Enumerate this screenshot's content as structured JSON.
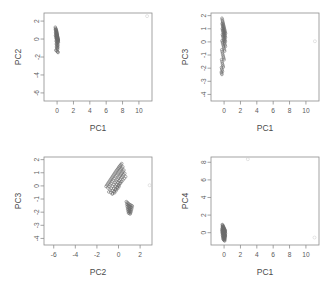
{
  "figure": {
    "title": "",
    "layout": "2x2 grid of PCA score scatterplots",
    "marker": "open-circle",
    "grid": false,
    "legend": "none"
  },
  "chart_data": [
    {
      "type": "scatter",
      "name": "pc2-vs-pc1",
      "title": "",
      "xlabel": "PC1",
      "ylabel": "PC2",
      "xlim": [
        -1.6,
        11.6
      ],
      "ylim": [
        -6.9,
        2.9
      ],
      "xticks": [
        0,
        2,
        4,
        6,
        8,
        10
      ],
      "yticks": [
        2,
        0,
        -2,
        -4,
        -6
      ],
      "grid": false,
      "series": [
        {
          "name": "scores",
          "x": [
            -0.22,
            -0.18,
            -0.15,
            -0.12,
            -0.1,
            -0.08,
            -0.06,
            -0.05,
            -0.03,
            -0.02,
            0.0,
            0.01,
            0.02,
            0.03,
            0.05,
            0.06,
            0.07,
            0.08,
            0.09,
            0.1,
            -0.2,
            -0.16,
            -0.13,
            -0.11,
            -0.09,
            -0.07,
            -0.04,
            -0.01,
            0.02,
            0.04,
            0.06,
            0.08,
            0.11,
            0.13,
            -0.17,
            -0.14,
            -0.12,
            -0.09,
            -0.06,
            -0.03,
            0.0,
            0.03,
            0.06,
            0.09,
            0.12,
            -0.19,
            -0.15,
            -0.1,
            -0.05,
            0.0,
            0.04,
            0.08,
            0.12,
            0.15,
            -0.13,
            -0.08,
            -0.04,
            0.01,
            0.05,
            0.09,
            -0.11,
            -0.06,
            -0.02,
            0.03,
            0.07,
            0.1,
            -0.09,
            -0.05,
            0.0,
            0.05,
            0.09,
            -0.07,
            -0.03,
            0.02,
            0.06,
            -0.14,
            -0.1,
            0.04,
            0.08,
            0.12
          ],
          "y": [
            1.32,
            1.2,
            1.12,
            1.05,
            0.98,
            0.9,
            0.84,
            0.76,
            0.7,
            0.62,
            0.55,
            0.48,
            0.4,
            0.33,
            0.26,
            0.18,
            0.12,
            0.05,
            -0.02,
            -0.1,
            1.05,
            0.95,
            0.86,
            0.78,
            0.68,
            0.6,
            0.5,
            0.42,
            0.33,
            0.24,
            0.15,
            0.06,
            -0.04,
            -0.13,
            0.72,
            0.63,
            0.54,
            0.45,
            0.36,
            0.27,
            0.18,
            0.09,
            0.0,
            -0.09,
            -0.18,
            0.4,
            0.32,
            0.22,
            0.12,
            0.02,
            -0.08,
            -0.18,
            -0.28,
            -0.36,
            0.1,
            0.0,
            -0.1,
            -0.2,
            -0.3,
            -0.4,
            -0.22,
            -0.32,
            -0.42,
            -0.52,
            -0.62,
            -0.7,
            -0.55,
            -0.65,
            -0.75,
            -0.85,
            -0.95,
            -0.88,
            -0.98,
            -1.06,
            -1.14,
            -1.22,
            -1.3,
            -1.38,
            -1.44,
            -1.5
          ]
        },
        {
          "name": "outlier",
          "x": [
            11.0
          ],
          "y": [
            2.55
          ]
        }
      ]
    },
    {
      "type": "scatter",
      "name": "pc3-vs-pc1",
      "title": "",
      "xlabel": "PC1",
      "ylabel": "PC3",
      "xlim": [
        -1.6,
        11.6
      ],
      "ylim": [
        -4.5,
        2.2
      ],
      "xticks": [
        0,
        2,
        4,
        6,
        8,
        10
      ],
      "yticks": [
        2,
        1,
        0,
        -1,
        -2,
        -3,
        -4
      ],
      "grid": false,
      "series": [
        {
          "name": "scores",
          "x": [
            -0.26,
            -0.22,
            -0.19,
            -0.16,
            -0.13,
            -0.1,
            -0.07,
            -0.04,
            -0.01,
            0.02,
            0.05,
            0.08,
            0.11,
            0.14,
            0.17,
            -0.24,
            -0.2,
            -0.17,
            -0.14,
            -0.11,
            -0.08,
            -0.05,
            -0.02,
            0.01,
            0.04,
            0.07,
            0.1,
            0.13,
            0.16,
            -0.22,
            -0.18,
            -0.15,
            -0.12,
            -0.09,
            -0.06,
            -0.03,
            0.0,
            0.03,
            0.06,
            0.09,
            0.12,
            0.15,
            -0.2,
            -0.16,
            -0.12,
            -0.08,
            -0.04,
            0.0,
            0.04,
            0.08,
            0.12,
            0.16,
            -0.25,
            -0.21,
            -0.17,
            -0.13,
            -0.09,
            -0.05,
            -0.01,
            0.03,
            0.07,
            -0.28,
            -0.24,
            -0.2,
            -0.16,
            -0.12,
            -0.08,
            -0.04,
            0.0,
            -0.3,
            -0.26,
            -0.22,
            -0.18,
            -0.14,
            -0.1,
            -0.32,
            -0.28,
            -0.24,
            -0.2,
            -0.34,
            -0.3,
            -0.26
          ],
          "y": [
            1.8,
            1.7,
            1.6,
            1.52,
            1.44,
            1.36,
            1.28,
            1.2,
            1.12,
            1.04,
            0.96,
            0.88,
            0.8,
            0.72,
            0.64,
            1.4,
            1.3,
            1.22,
            1.14,
            1.06,
            0.98,
            0.9,
            0.82,
            0.74,
            0.66,
            0.58,
            0.5,
            0.42,
            0.34,
            1.0,
            0.9,
            0.82,
            0.74,
            0.66,
            0.58,
            0.5,
            0.42,
            0.34,
            0.26,
            0.18,
            0.1,
            0.02,
            0.55,
            0.45,
            0.35,
            0.25,
            0.15,
            0.05,
            -0.05,
            -0.15,
            -0.25,
            -0.35,
            0.1,
            0.0,
            -0.1,
            -0.2,
            -0.3,
            -0.4,
            -0.5,
            -0.6,
            -0.7,
            -0.6,
            -0.72,
            -0.84,
            -0.96,
            -1.06,
            -1.16,
            -1.26,
            -1.36,
            -1.35,
            -1.48,
            -1.6,
            -1.72,
            -1.82,
            -1.92,
            -1.95,
            -2.06,
            -2.16,
            -2.26,
            -2.3,
            -2.4,
            -2.48
          ]
        },
        {
          "name": "outlier",
          "x": [
            11.1
          ],
          "y": [
            0.05
          ]
        }
      ]
    },
    {
      "type": "scatter",
      "name": "pc3-vs-pc2",
      "title": "",
      "xlabel": "PC2",
      "ylabel": "PC3",
      "xlim": [
        -6.9,
        3.1
      ],
      "ylim": [
        -4.5,
        2.2
      ],
      "xticks": [
        -6,
        -4,
        -2,
        0,
        2
      ],
      "yticks": [
        2,
        1,
        0,
        -1,
        -2,
        -3,
        -4
      ],
      "grid": false,
      "series": [
        {
          "name": "cluster-main",
          "x": [
            0.3,
            0.22,
            0.15,
            0.08,
            0.02,
            -0.05,
            -0.12,
            -0.2,
            -0.28,
            -0.36,
            -0.44,
            -0.52,
            -0.6,
            -0.68,
            -0.76,
            -0.84,
            -0.92,
            -1.0,
            -1.08,
            -1.16,
            0.4,
            0.32,
            0.24,
            0.16,
            0.08,
            0.0,
            -0.08,
            -0.18,
            -0.28,
            -0.38,
            -0.48,
            -0.58,
            -0.68,
            -0.78,
            -0.88,
            -0.98,
            0.5,
            0.42,
            0.34,
            0.26,
            0.18,
            0.1,
            0.0,
            -0.1,
            -0.2,
            -0.3,
            -0.42,
            -0.54,
            -0.66,
            -0.78,
            -0.9,
            0.58,
            0.48,
            0.38,
            0.28,
            0.18,
            0.06,
            -0.06,
            -0.18,
            -0.3,
            -0.44,
            -0.58,
            -0.72,
            0.66,
            0.54,
            0.42,
            0.3,
            0.18,
            0.04,
            -0.1,
            -0.26,
            -0.42,
            -0.58,
            0.2,
            0.1,
            -0.02,
            -0.14,
            -0.26,
            -0.4,
            -0.54,
            0.05,
            -0.08,
            -0.22,
            -0.36
          ],
          "y": [
            1.7,
            1.62,
            1.55,
            1.48,
            1.4,
            1.32,
            1.24,
            1.16,
            1.06,
            0.96,
            0.86,
            0.76,
            0.66,
            0.56,
            0.46,
            0.36,
            0.26,
            0.16,
            0.06,
            -0.04,
            1.45,
            1.36,
            1.28,
            1.2,
            1.1,
            1.0,
            0.9,
            0.8,
            0.68,
            0.56,
            0.44,
            0.32,
            0.2,
            0.08,
            -0.04,
            -0.16,
            1.2,
            1.1,
            1.0,
            0.92,
            0.82,
            0.72,
            0.6,
            0.48,
            0.36,
            0.24,
            0.1,
            -0.04,
            -0.18,
            -0.32,
            -0.46,
            0.95,
            0.85,
            0.74,
            0.64,
            0.52,
            0.4,
            0.26,
            0.12,
            -0.02,
            -0.18,
            -0.34,
            -0.5,
            0.7,
            0.58,
            0.46,
            0.34,
            0.2,
            0.06,
            -0.1,
            -0.26,
            -0.44,
            -0.62,
            0.3,
            0.18,
            0.04,
            -0.1,
            -0.26,
            -0.42,
            -0.58,
            -0.05,
            -0.2,
            -0.36,
            -0.52
          ]
        },
        {
          "name": "cluster-lower-right",
          "x": [
            0.72,
            0.8,
            0.88,
            0.96,
            1.04,
            1.12,
            1.2,
            1.28,
            0.76,
            0.84,
            0.92,
            1.0,
            1.08,
            1.16,
            1.24,
            0.8,
            0.88,
            0.96,
            1.04,
            1.12,
            1.2,
            0.84,
            0.92,
            1.0,
            1.08,
            1.16,
            0.88,
            0.96,
            1.04,
            1.12,
            0.92,
            1.0,
            1.08
          ],
          "y": [
            -1.2,
            -1.26,
            -1.32,
            -1.38,
            -1.42,
            -1.46,
            -1.5,
            -1.54,
            -1.4,
            -1.46,
            -1.52,
            -1.56,
            -1.6,
            -1.64,
            -1.68,
            -1.58,
            -1.64,
            -1.7,
            -1.74,
            -1.78,
            -1.82,
            -1.76,
            -1.82,
            -1.86,
            -1.9,
            -1.94,
            -1.92,
            -1.96,
            -2.0,
            -2.04,
            -2.06,
            -2.1,
            -2.14
          ]
        },
        {
          "name": "outlier",
          "x": [
            2.88
          ],
          "y": [
            0.05
          ]
        }
      ]
    },
    {
      "type": "scatter",
      "name": "pc4-vs-pc1",
      "title": "",
      "xlabel": "PC1",
      "ylabel": "PC4",
      "xlim": [
        -1.6,
        11.6
      ],
      "ylim": [
        -1.4,
        8.6
      ],
      "xticks": [
        0,
        2,
        4,
        6,
        8,
        10
      ],
      "yticks": [
        0,
        2,
        4,
        6,
        8
      ],
      "grid": false,
      "series": [
        {
          "name": "scores",
          "x": [
            -0.22,
            -0.18,
            -0.15,
            -0.12,
            -0.09,
            -0.06,
            -0.03,
            0.0,
            0.03,
            0.06,
            0.09,
            0.12,
            0.15,
            -0.2,
            -0.17,
            -0.14,
            -0.11,
            -0.08,
            -0.05,
            -0.02,
            0.01,
            0.04,
            0.07,
            0.1,
            0.13,
            -0.24,
            -0.2,
            -0.16,
            -0.12,
            -0.08,
            -0.04,
            0.0,
            0.04,
            0.08,
            0.12,
            0.16,
            -0.26,
            -0.22,
            -0.18,
            -0.14,
            -0.1,
            -0.06,
            -0.02,
            0.02,
            0.06,
            0.1,
            0.14,
            -0.24,
            -0.2,
            -0.15,
            -0.1,
            -0.05,
            0.0,
            0.05,
            0.1,
            0.15,
            -0.22,
            -0.17,
            -0.12,
            -0.07,
            -0.02,
            0.03,
            0.08,
            0.13,
            -0.19,
            -0.14,
            -0.09,
            -0.04,
            0.01,
            0.06,
            0.11,
            -0.16,
            -0.11,
            -0.06,
            -0.01,
            0.04,
            0.09,
            -0.13,
            -0.08,
            -0.03,
            0.02,
            0.07
          ],
          "y": [
            0.92,
            0.86,
            0.8,
            0.74,
            0.68,
            0.62,
            0.56,
            0.5,
            0.44,
            0.38,
            0.32,
            0.26,
            0.2,
            0.7,
            0.64,
            0.58,
            0.52,
            0.46,
            0.4,
            0.34,
            0.28,
            0.22,
            0.16,
            0.1,
            0.04,
            0.5,
            0.44,
            0.38,
            0.32,
            0.26,
            0.2,
            0.14,
            0.08,
            0.02,
            -0.04,
            -0.1,
            0.3,
            0.24,
            0.18,
            0.12,
            0.06,
            0.0,
            -0.06,
            -0.12,
            -0.18,
            -0.24,
            -0.3,
            0.1,
            0.04,
            -0.02,
            -0.08,
            -0.14,
            -0.2,
            -0.26,
            -0.32,
            -0.38,
            -0.1,
            -0.16,
            -0.22,
            -0.28,
            -0.34,
            -0.4,
            -0.46,
            -0.52,
            -0.3,
            -0.36,
            -0.42,
            -0.48,
            -0.54,
            -0.6,
            -0.66,
            -0.5,
            -0.56,
            -0.62,
            -0.68,
            -0.74,
            -0.8,
            -0.7,
            -0.76,
            -0.82,
            -0.88,
            -0.94
          ]
        },
        {
          "name": "outlier-top",
          "x": [
            2.9
          ],
          "y": [
            8.35
          ]
        },
        {
          "name": "outlier-right",
          "x": [
            11.05
          ],
          "y": [
            -0.55
          ]
        }
      ]
    }
  ]
}
